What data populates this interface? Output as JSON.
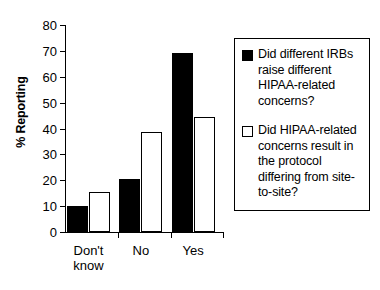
{
  "chart_data": {
    "type": "bar",
    "title": "",
    "xlabel": "",
    "ylabel": "% Reporting",
    "ylim": [
      0,
      80
    ],
    "yticks": [
      0,
      10,
      20,
      30,
      40,
      50,
      60,
      70,
      80
    ],
    "ytick_labels": [
      "0",
      "10",
      "20",
      "30",
      "40",
      "50",
      "60",
      "70",
      "80"
    ],
    "grid": false,
    "legend_position": "right",
    "categories": [
      "Don't know",
      "No",
      "Yes"
    ],
    "category_label_lines": [
      [
        "Don't",
        "know"
      ],
      [
        "No"
      ],
      [
        "Yes"
      ]
    ],
    "series": [
      {
        "name": "Did different IRBs raise different HIPAA-related concerns?",
        "color": "#000000",
        "style": "filled",
        "values": [
          10.0,
          20.5,
          69.0
        ]
      },
      {
        "name": "Did HIPAA-related concerns result in the protocol differing from site-to-site?",
        "color": "#ffffff",
        "style": "hollow",
        "values": [
          15.3,
          38.7,
          44.5
        ]
      }
    ],
    "legend": [
      {
        "swatch": "filled-black-square",
        "lines": [
          "Did different IRBs",
          "raise different",
          "HIPAA-related",
          "concerns?"
        ]
      },
      {
        "swatch": "hollow-white-square",
        "lines": [
          "Did HIPAA-related",
          "concerns result in",
          "the protocol",
          "differing from site-",
          "to-site?"
        ]
      }
    ]
  }
}
